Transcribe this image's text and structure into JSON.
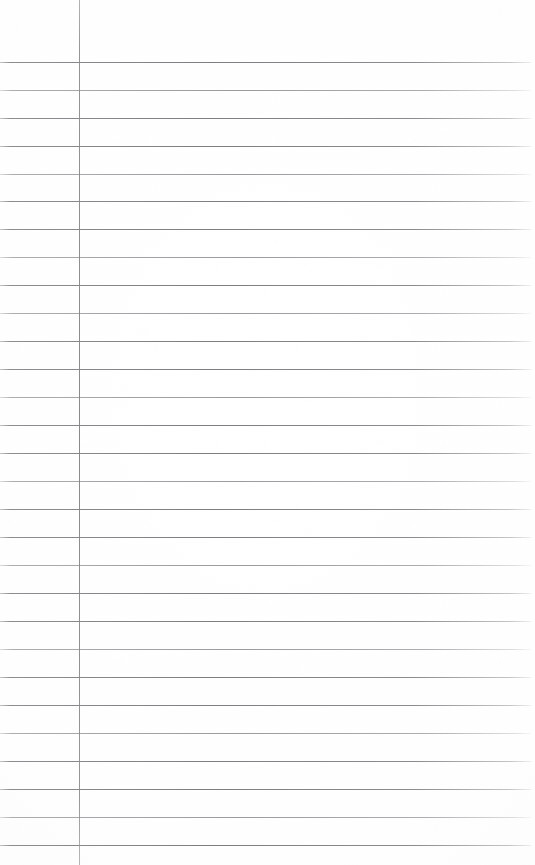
{
  "document": {
    "kind": "scanned-ruled-notebook-page",
    "title": "Ruled Notebook Page",
    "page_width": 535,
    "page_height": 865,
    "background_color": "#fefefe",
    "content_text": "",
    "has_handwriting": false,
    "is_blank": true
  },
  "ruling": {
    "line_color": "#82828a",
    "line_color_faint": "#92929a",
    "line_thickness": 1,
    "line_spacing": 27.9,
    "first_line_y": 62,
    "line_count": 29,
    "line_left_x": 0,
    "line_right_x": 531,
    "horizontal_lines_y": [
      62,
      90,
      118,
      146,
      174,
      201,
      229,
      257,
      285,
      313,
      341,
      369,
      397,
      425,
      453,
      481,
      509,
      537,
      565,
      593,
      621,
      649,
      677,
      705,
      733,
      761,
      789,
      817,
      845
    ],
    "faint_line_indices": [
      1,
      4,
      7,
      9,
      12,
      15,
      18,
      21,
      24,
      27
    ]
  },
  "margin_rule": {
    "name": "vertical-margin-line",
    "x": 79,
    "top_y": 0,
    "bottom_y": 865,
    "color": "#868690",
    "thickness": 1
  }
}
